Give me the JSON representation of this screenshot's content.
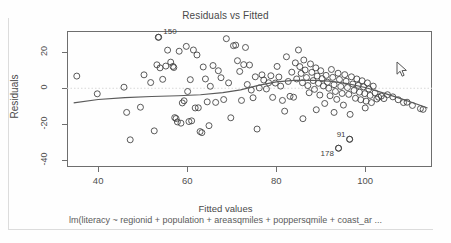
{
  "window": {
    "kind": "r-graphics-device",
    "background": "#fefefe"
  },
  "chart_data": {
    "type": "scatter",
    "title": "Residuals vs Fitted",
    "subtitle": "lm(literacy ~ regionid + population + areasqmiles + poppersqmile + coast_ar ...",
    "xlabel": "Fitted values",
    "ylabel": "Residuals",
    "xlim": [
      33,
      115
    ],
    "ylim": [
      -44,
      32
    ],
    "xticks": [
      40,
      60,
      80,
      100
    ],
    "yticks": [
      20,
      0,
      -20,
      -40
    ],
    "grid": false,
    "legend": null,
    "reference_line": {
      "y": 0,
      "style": "dotted",
      "color": "#d8d8d8"
    },
    "marker": {
      "shape": "open-circle",
      "color": "#3d3d3d",
      "size": 3
    },
    "smoother": {
      "name": "lowess",
      "color": "#5a5a5a",
      "points": [
        [
          34.5,
          -8.2
        ],
        [
          40.0,
          -6.3
        ],
        [
          46.0,
          -5.2
        ],
        [
          52.0,
          -4.6
        ],
        [
          58.0,
          -4.2
        ],
        [
          63.0,
          -3.6
        ],
        [
          68.0,
          -2.4
        ],
        [
          72.0,
          -0.9
        ],
        [
          76.0,
          1.6
        ],
        [
          80.0,
          3.6
        ],
        [
          84.0,
          4.4
        ],
        [
          88.0,
          4.5
        ],
        [
          92.0,
          4.0
        ],
        [
          96.0,
          2.6
        ],
        [
          100.0,
          0.4
        ],
        [
          104.0,
          -2.6
        ],
        [
          108.0,
          -5.8
        ],
        [
          112.0,
          -9.2
        ],
        [
          114.0,
          -11.0
        ]
      ]
    },
    "annotations": [
      {
        "label": "150",
        "x": 53.5,
        "y": 28.5
      },
      {
        "label": "178",
        "x": 94.0,
        "y": -33.5
      },
      {
        "label": "91",
        "x": 96.5,
        "y": -28.5
      }
    ],
    "points": [
      [
        35.2,
        6.8
      ],
      [
        39.8,
        -3.1
      ],
      [
        45.8,
        0.6
      ],
      [
        46.4,
        -13.5
      ],
      [
        47.2,
        -28.8
      ],
      [
        49.5,
        -10.6
      ],
      [
        50.3,
        7.5
      ],
      [
        51.8,
        3.2
      ],
      [
        52.6,
        -23.8
      ],
      [
        53.2,
        13.1
      ],
      [
        53.6,
        28.5
      ],
      [
        53.9,
        11.4
      ],
      [
        54.5,
        5.0
      ],
      [
        55.2,
        12.4
      ],
      [
        55.6,
        21.3
      ],
      [
        56.3,
        14.6
      ],
      [
        56.8,
        12.2
      ],
      [
        57.0,
        11.6
      ],
      [
        57.2,
        -16.4
      ],
      [
        57.5,
        -16.9
      ],
      [
        57.8,
        -18.8
      ],
      [
        58.2,
        20.7
      ],
      [
        58.6,
        -19.5
      ],
      [
        58.9,
        -8.2
      ],
      [
        59.3,
        -7.0
      ],
      [
        59.8,
        23.4
      ],
      [
        60.1,
        -1.8
      ],
      [
        60.4,
        -18.6
      ],
      [
        60.7,
        4.8
      ],
      [
        61.0,
        -18.2
      ],
      [
        61.4,
        21.4
      ],
      [
        61.8,
        -11.0
      ],
      [
        62.2,
        18.6
      ],
      [
        62.5,
        -10.9
      ],
      [
        62.9,
        -24.2
      ],
      [
        63.3,
        -24.8
      ],
      [
        63.6,
        11.9
      ],
      [
        64.1,
        5.2
      ],
      [
        64.5,
        -7.6
      ],
      [
        64.9,
        -20.9
      ],
      [
        65.2,
        1.1
      ],
      [
        65.8,
        12.7
      ],
      [
        66.4,
        -7.9
      ],
      [
        67.0,
        9.8
      ],
      [
        67.6,
        5.9
      ],
      [
        68.2,
        -6.3
      ],
      [
        68.8,
        27.7
      ],
      [
        69.3,
        3.0
      ],
      [
        69.8,
        -16.5
      ],
      [
        70.4,
        23.8
      ],
      [
        70.9,
        24.1
      ],
      [
        71.3,
        15.4
      ],
      [
        71.8,
        9.4
      ],
      [
        72.2,
        -6.8
      ],
      [
        72.7,
        13.2
      ],
      [
        73.1,
        22.8
      ],
      [
        73.5,
        2.1
      ],
      [
        74.0,
        13.0
      ],
      [
        74.4,
        -1.0
      ],
      [
        74.8,
        -5.3
      ],
      [
        75.3,
        6.4
      ],
      [
        75.7,
        -22.8
      ],
      [
        76.2,
        0.2
      ],
      [
        76.8,
        7.5
      ],
      [
        77.2,
        4.6
      ],
      [
        77.8,
        -0.4
      ],
      [
        78.3,
        3.1
      ],
      [
        78.8,
        7.0
      ],
      [
        79.2,
        -5.1
      ],
      [
        79.8,
        2.9
      ],
      [
        80.2,
        12.2
      ],
      [
        80.6,
        6.3
      ],
      [
        81.0,
        1.2
      ],
      [
        81.4,
        -6.8
      ],
      [
        81.9,
        -12.8
      ],
      [
        82.3,
        17.6
      ],
      [
        82.7,
        3.8
      ],
      [
        83.1,
        -4.5
      ],
      [
        83.5,
        9.0
      ],
      [
        83.9,
        -5.0
      ],
      [
        84.3,
        14.2
      ],
      [
        84.6,
        5.2
      ],
      [
        85.0,
        21.4
      ],
      [
        85.3,
        12.1
      ],
      [
        85.6,
        8.3
      ],
      [
        85.9,
        3.1
      ],
      [
        86.2,
        15.8
      ],
      [
        86.5,
        10.2
      ],
      [
        86.8,
        6.0
      ],
      [
        87.1,
        1.5
      ],
      [
        87.4,
        -2.5
      ],
      [
        87.7,
        13.6
      ],
      [
        88.0,
        8.9
      ],
      [
        88.3,
        4.3
      ],
      [
        88.6,
        -0.6
      ],
      [
        88.9,
        11.4
      ],
      [
        89.2,
        6.8
      ],
      [
        89.5,
        2.8
      ],
      [
        89.8,
        -3.8
      ],
      [
        90.0,
        9.8
      ],
      [
        90.3,
        5.4
      ],
      [
        90.6,
        1.3
      ],
      [
        90.9,
        -8.5
      ],
      [
        91.2,
        7.2
      ],
      [
        91.5,
        3.4
      ],
      [
        91.8,
        0.0
      ],
      [
        92.1,
        -4.2
      ],
      [
        92.4,
        10.5
      ],
      [
        92.7,
        6.1
      ],
      [
        93.0,
        2.0
      ],
      [
        93.3,
        -1.8
      ],
      [
        93.6,
        -6.2
      ],
      [
        93.9,
        8.4
      ],
      [
        94.2,
        4.9
      ],
      [
        94.5,
        1.0
      ],
      [
        94.8,
        -2.9
      ],
      [
        95.1,
        -9.4
      ],
      [
        95.4,
        7.6
      ],
      [
        95.7,
        3.9
      ],
      [
        96.0,
        0.4
      ],
      [
        96.3,
        -3.4
      ],
      [
        96.6,
        -14.6
      ],
      [
        96.9,
        6.4
      ],
      [
        97.2,
        2.4
      ],
      [
        97.5,
        -1.2
      ],
      [
        97.8,
        -5.6
      ],
      [
        98.1,
        5.2
      ],
      [
        98.4,
        1.6
      ],
      [
        98.7,
        -2.2
      ],
      [
        99.0,
        -6.4
      ],
      [
        99.3,
        4.2
      ],
      [
        99.6,
        0.8
      ],
      [
        99.9,
        -3.0
      ],
      [
        100.2,
        -7.2
      ],
      [
        100.5,
        3.0
      ],
      [
        100.8,
        -0.4
      ],
      [
        101.1,
        -4.0
      ],
      [
        101.4,
        -8.0
      ],
      [
        101.8,
        1.2
      ],
      [
        102.2,
        -2.6
      ],
      [
        102.6,
        -6.0
      ],
      [
        103.0,
        -5.0
      ],
      [
        103.6,
        -4.4
      ],
      [
        104.2,
        -5.8
      ],
      [
        105.0,
        -3.6
      ],
      [
        106.2,
        -4.8
      ],
      [
        107.4,
        -6.4
      ],
      [
        108.6,
        -8.0
      ],
      [
        109.4,
        -7.8
      ],
      [
        110.6,
        -9.6
      ],
      [
        112.4,
        -11.4
      ],
      [
        113.0,
        -11.8
      ],
      [
        94.0,
        -33.5
      ],
      [
        96.5,
        -28.5
      ],
      [
        86.0,
        -17.0
      ],
      [
        89.0,
        -12.0
      ],
      [
        93.0,
        -13.5
      ],
      [
        100.0,
        -11.0
      ]
    ]
  },
  "cursor": {
    "icon": "mouse-pointer",
    "x": 399,
    "y": 66
  }
}
